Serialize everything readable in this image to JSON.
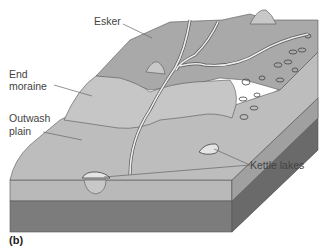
{
  "figure": {
    "panel_label": "(b)",
    "labels": {
      "esker": "Esker",
      "end_moraine_line1": "End",
      "end_moraine_line2": "moraine",
      "outwash_line1": "Outwash",
      "outwash_line2": "plain",
      "kettle_lakes": "Kettle lakes"
    }
  },
  "colors": {
    "background": "#ffffff",
    "upland": "#a9a9a9",
    "moraine": "#c4c4c4",
    "outwash": "#bdbdbd",
    "top_layer_front": "#b8b8b8",
    "bedrock_front": "#7c7c7c",
    "bedrock_side": "#666666",
    "side_layer": "#9a9a9a",
    "stream": "#e8e8e8",
    "line": "#555555"
  }
}
